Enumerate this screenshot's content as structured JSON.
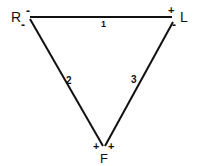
{
  "diagram": {
    "type": "triangle-circuit",
    "stroke_color": "#111111",
    "background": "#ffffff",
    "nodes": [
      {
        "id": "R",
        "label": "R",
        "signs": [
          "-",
          "-"
        ],
        "x": 29,
        "y": 18
      },
      {
        "id": "L",
        "label": "L",
        "signs": [
          "+",
          "-"
        ],
        "x": 173,
        "y": 18
      },
      {
        "id": "F",
        "label": "F",
        "signs": [
          "+",
          "+"
        ],
        "x": 104,
        "y": 147
      }
    ],
    "edges": [
      {
        "id": "1",
        "label": "1",
        "from": "R",
        "to": "L"
      },
      {
        "id": "2",
        "label": "2",
        "from": "R",
        "to": "F"
      },
      {
        "id": "3",
        "label": "3",
        "from": "L",
        "to": "F"
      }
    ]
  }
}
